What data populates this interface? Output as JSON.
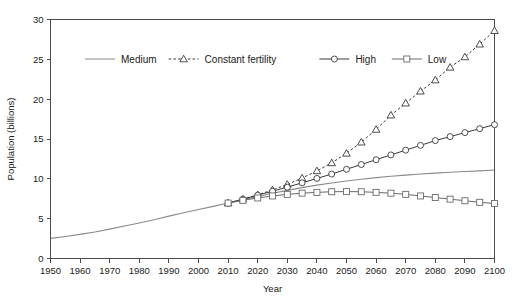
{
  "chart": {
    "type": "line",
    "title": "",
    "xlabel": "Year",
    "ylabel": "Population (billions)",
    "xlim": [
      1950,
      2100
    ],
    "ylim": [
      0,
      30
    ],
    "grid": false,
    "legend_position": "top-left-inside"
  },
  "axes": {
    "y_ticks": [
      "0",
      "5",
      "10",
      "15",
      "20",
      "25",
      "30"
    ],
    "x_ticks": [
      "1950",
      "1960",
      "1970",
      "1980",
      "1990",
      "2000",
      "2010",
      "2020",
      "2030",
      "2040",
      "2050",
      "2060",
      "2070",
      "2080",
      "2090",
      "2100"
    ]
  },
  "legend": {
    "items": [
      {
        "label": "Medium",
        "style": "solid-line",
        "marker": "none",
        "color": "#8a8a8a"
      },
      {
        "label": "Constant fertility",
        "style": "dashed-line",
        "marker": "triangle",
        "color": "#3a3a3a"
      },
      {
        "label": "High",
        "style": "solid-line",
        "marker": "circle",
        "color": "#3a3a3a"
      },
      {
        "label": "Low",
        "style": "solid-line",
        "marker": "square",
        "color": "#6a6a6a"
      }
    ]
  },
  "chart_data": {
    "type": "line",
    "title": "",
    "xlabel": "Year",
    "ylabel": "Population (billions)",
    "xlim": [
      1950,
      2100
    ],
    "ylim": [
      0,
      30
    ],
    "grid": false,
    "legend_position": "top-left-inside",
    "x": [
      1950,
      1955,
      1960,
      1965,
      1970,
      1975,
      1980,
      1985,
      1990,
      1995,
      2000,
      2005,
      2010,
      2015,
      2020,
      2025,
      2030,
      2035,
      2040,
      2045,
      2050,
      2055,
      2060,
      2065,
      2070,
      2075,
      2080,
      2085,
      2090,
      2095,
      2100
    ],
    "series": [
      {
        "name": "Medium",
        "marker": "none",
        "linestyle": "solid",
        "color": "#8a8a8a",
        "values": [
          2.53,
          2.77,
          3.03,
          3.33,
          3.69,
          4.07,
          4.45,
          4.87,
          5.32,
          5.74,
          6.14,
          6.54,
          6.96,
          7.38,
          7.79,
          8.18,
          8.55,
          8.9,
          9.21,
          9.48,
          9.73,
          9.95,
          10.15,
          10.32,
          10.47,
          10.6,
          10.72,
          10.82,
          10.92,
          11.0,
          11.1
        ]
      },
      {
        "name": "Constant fertility",
        "marker": "triangle",
        "linestyle": "dashed",
        "color": "#3a3a3a",
        "marker_start_year": 2010,
        "values": [
          null,
          null,
          null,
          null,
          null,
          null,
          null,
          null,
          null,
          null,
          null,
          null,
          6.96,
          7.45,
          8.0,
          8.6,
          9.3,
          10.1,
          11.0,
          12.0,
          13.2,
          14.6,
          16.2,
          18.0,
          19.5,
          21.0,
          22.4,
          24.0,
          25.3,
          26.9,
          28.6
        ]
      },
      {
        "name": "High",
        "marker": "circle",
        "linestyle": "solid",
        "color": "#3a3a3a",
        "marker_start_year": 2010,
        "values": [
          null,
          null,
          null,
          null,
          null,
          null,
          null,
          null,
          null,
          null,
          null,
          null,
          6.96,
          7.45,
          7.95,
          8.45,
          8.95,
          9.5,
          10.05,
          10.6,
          11.2,
          11.8,
          12.4,
          13.0,
          13.6,
          14.2,
          14.8,
          15.3,
          15.8,
          16.3,
          16.8
        ]
      },
      {
        "name": "Low",
        "marker": "square",
        "linestyle": "solid",
        "color": "#6a6a6a",
        "marker_start_year": 2010,
        "values": [
          null,
          null,
          null,
          null,
          null,
          null,
          null,
          null,
          null,
          null,
          null,
          null,
          6.96,
          7.3,
          7.6,
          7.85,
          8.05,
          8.2,
          8.3,
          8.38,
          8.4,
          8.38,
          8.3,
          8.2,
          8.05,
          7.85,
          7.65,
          7.45,
          7.25,
          7.05,
          6.9
        ]
      }
    ]
  }
}
